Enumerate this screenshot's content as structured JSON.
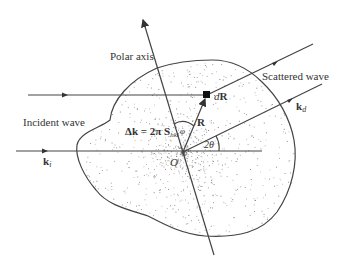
{
  "labels": {
    "polar_axis": "Polar axis",
    "scattered_wave": "Scattered wave",
    "incident_wave": "Incident wave",
    "dR_d": "d",
    "dR_R": "R",
    "R": "R",
    "k_d_k": "k",
    "k_d_sub": "d",
    "k_i_k": "k",
    "k_i_sub": "i",
    "delta_k": "Δk = 2π S",
    "delta_k_sub": "hkl",
    "phi": "φ",
    "two_theta": "2θ",
    "origin": "O"
  },
  "colors": {
    "line": "#444444",
    "text": "#333333",
    "dots": "#555555"
  }
}
